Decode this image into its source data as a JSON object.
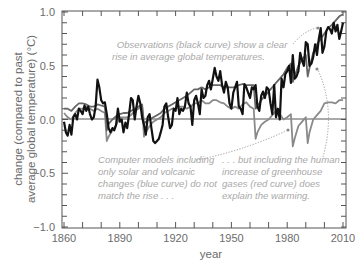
{
  "chart_data": {
    "type": "line",
    "title": "",
    "xlabel": "year",
    "ylabel": "change (compared to past average global temperature) (°C)",
    "ylabel_lines": [
      "change (compared to past",
      "average global temperature) (°C)"
    ],
    "xlim": [
      1860,
      2010
    ],
    "ylim": [
      -1.0,
      1.0
    ],
    "x_ticks": [
      1860,
      1890,
      1920,
      1950,
      1980,
      2010
    ],
    "x_tick_labels": [
      "1860",
      "1890",
      "1920",
      "1950",
      "1980",
      "2010"
    ],
    "y_ticks": [
      -1.0,
      -0.5,
      0.0,
      0.5,
      1.0
    ],
    "y_tick_labels": [
      "−1.0",
      "−0.5",
      "0.0",
      "0.5",
      "1.0"
    ],
    "grid": false,
    "zero_line": true,
    "legend": null,
    "series": [
      {
        "name": "Observations (black curve)",
        "color": "#111111",
        "width": 2.2,
        "x": [
          1860,
          1861,
          1862,
          1863,
          1864,
          1865,
          1866,
          1867,
          1868,
          1869,
          1870,
          1871,
          1872,
          1873,
          1874,
          1875,
          1876,
          1877,
          1878,
          1879,
          1880,
          1881,
          1882,
          1883,
          1884,
          1885,
          1886,
          1887,
          1888,
          1889,
          1890,
          1891,
          1892,
          1893,
          1894,
          1895,
          1896,
          1897,
          1898,
          1899,
          1900,
          1901,
          1902,
          1903,
          1904,
          1905,
          1906,
          1907,
          1908,
          1909,
          1910,
          1911,
          1912,
          1913,
          1914,
          1915,
          1916,
          1917,
          1918,
          1919,
          1920,
          1921,
          1922,
          1923,
          1924,
          1925,
          1926,
          1927,
          1928,
          1929,
          1930,
          1931,
          1932,
          1933,
          1934,
          1935,
          1936,
          1937,
          1938,
          1939,
          1940,
          1941,
          1942,
          1943,
          1944,
          1945,
          1946,
          1947,
          1948,
          1949,
          1950,
          1951,
          1952,
          1953,
          1954,
          1955,
          1956,
          1957,
          1958,
          1959,
          1960,
          1961,
          1962,
          1963,
          1964,
          1965,
          1966,
          1967,
          1968,
          1969,
          1970,
          1971,
          1972,
          1973,
          1974,
          1975,
          1976,
          1977,
          1978,
          1979,
          1980,
          1981,
          1982,
          1983,
          1984,
          1985,
          1986,
          1987,
          1988,
          1989,
          1990,
          1991,
          1992,
          1993,
          1994,
          1995,
          1996,
          1997,
          1998,
          1999,
          2000,
          2001,
          2002,
          2003,
          2004,
          2005,
          2006,
          2007,
          2008,
          2009,
          2010
        ],
        "y": [
          -0.02,
          -0.12,
          -0.15,
          -0.05,
          -0.14,
          0.02,
          0.05,
          0.0,
          0.1,
          0.08,
          0.05,
          0.13,
          0.08,
          0.12,
          0.05,
          0.0,
          0.02,
          0.12,
          0.37,
          0.3,
          0.18,
          0.15,
          0.16,
          0.05,
          -0.08,
          -0.12,
          -0.08,
          -0.1,
          -0.05,
          0.1,
          -0.02,
          0.0,
          -0.12,
          -0.03,
          -0.08,
          0.05,
          0.2,
          0.18,
          0.0,
          0.12,
          0.22,
          0.15,
          0.02,
          -0.05,
          -0.14,
          0.02,
          0.05,
          -0.08,
          -0.2,
          -0.22,
          -0.2,
          -0.18,
          -0.12,
          -0.05,
          0.12,
          0.15,
          0.02,
          -0.08,
          -0.05,
          0.1,
          0.08,
          0.2,
          0.05,
          0.1,
          0.08,
          0.12,
          0.25,
          0.15,
          0.12,
          -0.05,
          0.18,
          0.22,
          0.15,
          0.05,
          0.28,
          0.2,
          0.22,
          0.32,
          0.36,
          0.28,
          0.38,
          0.48,
          0.4,
          0.36,
          0.45,
          0.32,
          0.25,
          0.35,
          0.3,
          0.15,
          0.1,
          0.25,
          0.3,
          0.35,
          0.12,
          0.1,
          0.05,
          0.33,
          0.3,
          0.25,
          0.2,
          0.3,
          0.28,
          0.32,
          0.12,
          0.08,
          0.22,
          0.26,
          0.2,
          0.3,
          0.28,
          0.15,
          0.05,
          0.32,
          0.02,
          0.1,
          0.0,
          0.38,
          0.3,
          0.42,
          0.45,
          0.5,
          0.34,
          0.6,
          0.38,
          0.4,
          0.45,
          0.62,
          0.55,
          0.5,
          0.72,
          0.7,
          0.5,
          0.52,
          0.58,
          0.7,
          0.6,
          0.75,
          0.85,
          0.62,
          0.68,
          0.82,
          0.86,
          0.84,
          0.8,
          0.9,
          0.82,
          0.88,
          0.75,
          0.82,
          0.9
        ]
      },
      {
        "name": "Model: solar + volcanic + greenhouse (red curve)",
        "color": "#666666",
        "width": 1.8,
        "x": [
          1860,
          1862,
          1864,
          1866,
          1868,
          1870,
          1872,
          1874,
          1876,
          1878,
          1880,
          1882,
          1883,
          1884,
          1886,
          1888,
          1890,
          1892,
          1894,
          1896,
          1898,
          1900,
          1902,
          1903,
          1904,
          1906,
          1908,
          1910,
          1912,
          1914,
          1916,
          1918,
          1920,
          1922,
          1924,
          1926,
          1928,
          1930,
          1932,
          1934,
          1936,
          1938,
          1940,
          1942,
          1944,
          1946,
          1948,
          1950,
          1952,
          1954,
          1956,
          1958,
          1960,
          1962,
          1963,
          1964,
          1966,
          1968,
          1970,
          1972,
          1974,
          1976,
          1978,
          1980,
          1982,
          1983,
          1984,
          1986,
          1988,
          1990,
          1991,
          1992,
          1994,
          1996,
          1998,
          2000,
          2002,
          2004,
          2006,
          2008,
          2010
        ],
        "y": [
          0.1,
          0.1,
          0.08,
          0.12,
          0.15,
          0.15,
          0.14,
          0.12,
          0.12,
          0.14,
          0.13,
          0.12,
          -0.1,
          -0.04,
          0.0,
          0.03,
          0.05,
          0.06,
          0.06,
          0.08,
          0.1,
          0.12,
          0.14,
          -0.04,
          -0.02,
          0.0,
          0.02,
          0.04,
          0.06,
          0.1,
          0.12,
          0.14,
          0.16,
          0.18,
          0.2,
          0.22,
          0.25,
          0.28,
          0.28,
          0.3,
          0.28,
          0.3,
          0.32,
          0.32,
          0.32,
          0.3,
          0.3,
          0.3,
          0.3,
          0.32,
          0.33,
          0.32,
          0.32,
          0.32,
          0.1,
          0.12,
          0.18,
          0.22,
          0.26,
          0.3,
          0.34,
          0.38,
          0.42,
          0.48,
          0.52,
          0.35,
          0.4,
          0.5,
          0.56,
          0.6,
          0.4,
          0.48,
          0.62,
          0.7,
          0.75,
          0.8,
          0.85,
          0.88,
          0.92,
          0.96,
          0.98
        ]
      },
      {
        "name": "Model: solar + volcanic only (blue curve)",
        "color": "#8a8a8a",
        "width": 1.8,
        "x": [
          1860,
          1862,
          1864,
          1866,
          1868,
          1870,
          1872,
          1874,
          1876,
          1878,
          1880,
          1882,
          1883,
          1884,
          1886,
          1888,
          1890,
          1892,
          1894,
          1896,
          1898,
          1900,
          1902,
          1903,
          1904,
          1906,
          1908,
          1910,
          1912,
          1914,
          1916,
          1918,
          1920,
          1922,
          1924,
          1926,
          1928,
          1930,
          1932,
          1934,
          1936,
          1938,
          1940,
          1942,
          1944,
          1946,
          1948,
          1950,
          1952,
          1954,
          1956,
          1958,
          1960,
          1962,
          1963,
          1964,
          1966,
          1968,
          1970,
          1972,
          1974,
          1976,
          1978,
          1980,
          1982,
          1983,
          1984,
          1986,
          1988,
          1990,
          1991,
          1992,
          1994,
          1996,
          1998,
          2000,
          2002,
          2004,
          2006,
          2008,
          2010
        ],
        "y": [
          0.06,
          0.02,
          0.0,
          0.06,
          0.1,
          0.1,
          0.12,
          0.1,
          0.08,
          0.1,
          0.08,
          0.06,
          -0.2,
          -0.16,
          -0.1,
          -0.05,
          0.02,
          0.02,
          0.02,
          0.04,
          0.08,
          0.1,
          0.12,
          -0.16,
          -0.12,
          -0.06,
          -0.02,
          0.0,
          0.02,
          0.06,
          0.08,
          0.1,
          0.1,
          0.12,
          0.12,
          0.1,
          0.12,
          0.15,
          0.15,
          0.18,
          0.15,
          0.15,
          0.18,
          0.18,
          0.16,
          0.15,
          0.12,
          0.1,
          0.12,
          0.1,
          0.14,
          0.16,
          0.12,
          0.1,
          -0.18,
          -0.12,
          -0.05,
          -0.02,
          0.0,
          0.04,
          0.08,
          0.05,
          0.0,
          0.02,
          0.05,
          -0.25,
          -0.18,
          -0.06,
          -0.02,
          0.02,
          -0.22,
          -0.12,
          0.0,
          0.04,
          0.08,
          0.15,
          0.16,
          0.16,
          0.15,
          0.18,
          0.18
        ]
      }
    ],
    "annotations": [
      {
        "id": "observations",
        "lines": [
          "Observations (black curve) show a clear",
          "rise in average global temperatures."
        ],
        "arrow_to_year": 2000,
        "arrow_to_value": 0.9
      },
      {
        "id": "solar-volcanic",
        "lines": [
          "Computer models including",
          "only solar and volcanic",
          "changes (blue curve) do not",
          "match the rise . . ."
        ],
        "arrow_to_year": 1968,
        "arrow_to_value": -0.2
      },
      {
        "id": "greenhouse",
        "lines": [
          ". . . but including the human",
          "increase of greenhouse",
          "gases (red curve) does",
          "explain the warming."
        ],
        "arrow_to_year": 1993,
        "arrow_to_value": 0.45
      }
    ]
  }
}
